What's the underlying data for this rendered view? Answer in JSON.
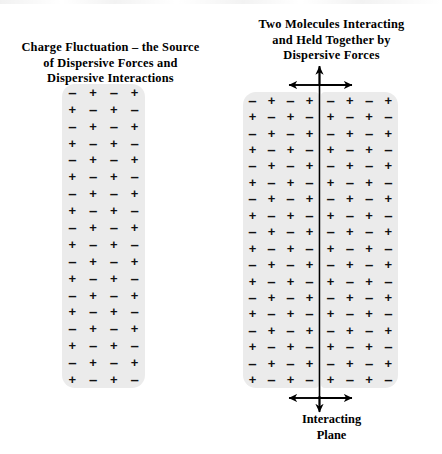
{
  "figure": {
    "background_color": "#ffffff",
    "ink_color": "#000000",
    "molecule_fill_color": "#ebebeb"
  },
  "left_panel": {
    "title": "Charge Fluctuation – the Source\nof Dispersive Forces and\nDispersive Interactions",
    "molecule": {
      "columns": 4,
      "rows": 18,
      "pattern": "checkerboard",
      "row_even": [
        "–",
        "+",
        "–",
        "+"
      ],
      "row_odd": [
        "+",
        "–",
        "+",
        "–"
      ]
    }
  },
  "right_panel": {
    "title": "Two Molecules Interacting\nand Held Together by\nDispersive Forces",
    "plane_caption": "Interacting\nPlane",
    "molecule_a": {
      "columns": 4,
      "rows": 18,
      "pattern": "checkerboard",
      "row_even": [
        "–",
        "+",
        "–",
        "+"
      ],
      "row_odd": [
        "+",
        "–",
        "+",
        "–"
      ]
    },
    "molecule_b": {
      "columns": 4,
      "rows": 18,
      "pattern": "checkerboard",
      "row_even": [
        "–",
        "+",
        "–",
        "+"
      ],
      "row_odd": [
        "+",
        "–",
        "+",
        "–"
      ]
    },
    "annotations": {
      "plane_line": "vertical-interacting-plane-line",
      "top_arrow_up": "arrow-up",
      "top_arrow_double": "double-headed-horizontal-arrow",
      "bottom_arrow_double": "double-headed-horizontal-arrow",
      "bottom_arrow_down": "arrow-down"
    }
  },
  "symbols": {
    "positive": "+",
    "negative": "–"
  }
}
